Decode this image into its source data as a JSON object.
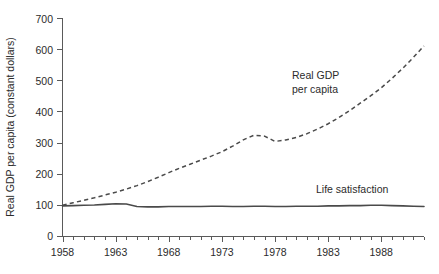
{
  "chart_data": {
    "type": "line",
    "title": "",
    "xlabel": "",
    "ylabel": "Real GDP per capita (constant dollars)",
    "xlim": [
      1958,
      1992
    ],
    "ylim": [
      0,
      700
    ],
    "grid": false,
    "legend_position": "inline-annotation",
    "y_ticks": [
      0,
      100,
      200,
      300,
      400,
      500,
      600,
      700
    ],
    "y_tick_labels": [
      "0",
      "100",
      "200",
      "300",
      "400",
      "500",
      "600",
      "700"
    ],
    "x_ticks": [
      1958,
      1963,
      1968,
      1973,
      1978,
      1983,
      1988
    ],
    "x_tick_labels": [
      "1958",
      "1963",
      "1968",
      "1973",
      "1978",
      "1983",
      "1988"
    ],
    "x_minor_tick_step": 1,
    "x": [
      1958,
      1959,
      1960,
      1961,
      1962,
      1963,
      1964,
      1965,
      1966,
      1967,
      1968,
      1969,
      1970,
      1971,
      1972,
      1973,
      1974,
      1975,
      1976,
      1977,
      1978,
      1979,
      1980,
      1981,
      1982,
      1983,
      1984,
      1985,
      1986,
      1987,
      1988,
      1989,
      1990,
      1991,
      1992
    ],
    "series": [
      {
        "name": "Real GDP per capita",
        "style": "dashed",
        "color": "#4a4a4a",
        "annotation": "Real GDP\nper capita",
        "values": [
          100,
          108,
          116,
          124,
          133,
          142,
          152,
          163,
          176,
          190,
          205,
          219,
          232,
          245,
          258,
          272,
          290,
          310,
          325,
          322,
          305,
          310,
          318,
          330,
          345,
          362,
          382,
          404,
          428,
          452,
          478,
          508,
          540,
          575,
          612
        ]
      },
      {
        "name": "Life satisfaction",
        "style": "solid",
        "color": "#4a4a4a",
        "annotation": "Life satisfaction",
        "values": [
          98,
          99,
          100,
          101,
          103,
          105,
          104,
          96,
          95,
          95,
          96,
          96,
          96,
          96,
          97,
          97,
          96,
          96,
          97,
          97,
          96,
          96,
          97,
          97,
          97,
          98,
          98,
          99,
          99,
          100,
          100,
          99,
          98,
          97,
          96
        ]
      }
    ],
    "annotations": [
      {
        "text_line1": "Real GDP",
        "text_line2": "per capita",
        "series": "Real GDP per capita"
      },
      {
        "text_line1": "Life satisfaction",
        "text_line2": "",
        "series": "Life satisfaction"
      }
    ]
  },
  "annotation_gdp": {
    "line1": "Real GDP",
    "line2": "per capita"
  },
  "annotation_life": {
    "line1": "Life satisfaction"
  },
  "axes": {
    "y_title": "Real GDP per capita (constant dollars)"
  },
  "y_labels": {
    "t0": "0",
    "t1": "100",
    "t2": "200",
    "t3": "300",
    "t4": "400",
    "t5": "500",
    "t6": "600",
    "t7": "700"
  },
  "x_labels": {
    "t0": "1958",
    "t1": "1963",
    "t2": "1968",
    "t3": "1973",
    "t4": "1978",
    "t5": "1983",
    "t6": "1988"
  }
}
